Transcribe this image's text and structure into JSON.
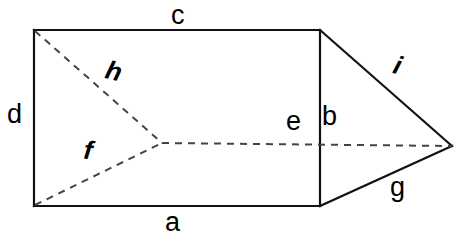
{
  "figure": {
    "background_color": "#ffffff",
    "solid_edge_color": "#111111",
    "hidden_edge_color": "#444444",
    "labels": [
      {
        "id": "a",
        "text": "a",
        "style": "upright",
        "position": "below-bottom-edge"
      },
      {
        "id": "b",
        "text": "b",
        "style": "upright",
        "position": "right-of-vertical-edge"
      },
      {
        "id": "c",
        "text": "c",
        "style": "upright",
        "position": "above-top-edge"
      },
      {
        "id": "d",
        "text": "d",
        "style": "upright",
        "position": "left-of-left-edge"
      },
      {
        "id": "e",
        "text": "e",
        "style": "upright",
        "position": "above-horizontal-dashed-edge"
      },
      {
        "id": "f",
        "text": "f",
        "style": "italic",
        "position": "along-lower-dashed-edge"
      },
      {
        "id": "g",
        "text": "g",
        "style": "upright",
        "position": "below-lower-slanted-edge"
      },
      {
        "id": "h",
        "text": "h",
        "style": "italic",
        "position": "along-upper-dashed-edge"
      },
      {
        "id": "i",
        "text": "i",
        "style": "italic",
        "position": "above-upper-slanted-edge"
      }
    ],
    "geometry": {
      "rect_top_left": [
        34,
        30
      ],
      "rect_top_right": [
        320,
        30
      ],
      "rect_bottom_right": [
        320,
        206
      ],
      "rect_bottom_left": [
        34,
        206
      ],
      "apex_right": [
        452,
        146
      ],
      "interior_vertex": [
        162,
        143
      ]
    }
  }
}
